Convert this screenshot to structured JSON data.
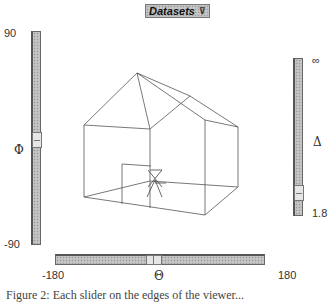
{
  "toolbar": {
    "datasets_label": "Datasets",
    "datasets_icon": "chevron-down-icon"
  },
  "phi_slider": {
    "symbol": "Φ",
    "max_label": "90",
    "min_label": "-90",
    "thumb_position": "middle"
  },
  "theta_slider": {
    "symbol": "Θ",
    "min_label": "-180",
    "max_label": "180",
    "thumb_position": "middle"
  },
  "delta_slider": {
    "symbol": "Δ",
    "max_label": "∞",
    "min_label": "1.8",
    "thumb_position": "near-bottom"
  },
  "scene": {
    "object": "house-wireframe",
    "viewer_marker": "stick-figure"
  },
  "caption": {
    "text": "Figure 2: Each slider on the edges of the viewer..."
  }
}
